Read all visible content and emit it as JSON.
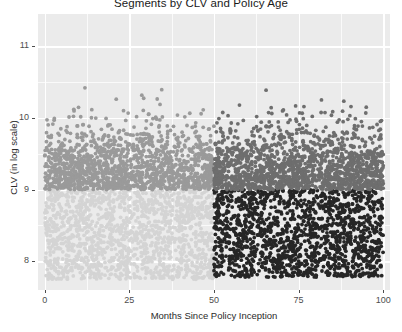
{
  "chart_data": {
    "type": "scatter",
    "title": "Segments by CLV and Policy Age",
    "xlabel": "Months Since Policy Inception",
    "ylabel": "CLV (in log scale)",
    "xlim": [
      -2,
      102
    ],
    "ylim": [
      7.6,
      11.45
    ],
    "xticks": [
      0,
      25,
      50,
      75,
      100
    ],
    "xtick_labels": [
      "0",
      "25",
      "50",
      "75",
      "100"
    ],
    "yticks": [
      8,
      9,
      10,
      11
    ],
    "ytick_labels": [
      "8",
      "9",
      "10",
      "11"
    ],
    "grid": true,
    "legend": "none",
    "panel_background": "#EBEBEB",
    "gridline_color": "#FFFFFF",
    "point_radius": 1.9,
    "series": [
      {
        "name": "segment-low-clv-new-policy",
        "color": "#D4D4D4",
        "n_points": 1500,
        "x_range": [
          0,
          50
        ],
        "y_range": [
          7.75,
          9.0
        ],
        "x_mean": 25,
        "y_mean": 8.45,
        "description": "Light gray cluster: low CLV, policy age 0-50 months"
      },
      {
        "name": "segment-high-clv-new-policy",
        "color": "#9A9A9A",
        "n_points": 1500,
        "x_range": [
          0,
          50
        ],
        "y_range": [
          9.0,
          11.35
        ],
        "x_mean": 25,
        "y_mean": 9.55,
        "description": "Medium gray cluster: high CLV, policy age 0-50 months"
      },
      {
        "name": "segment-low-clv-mature-policy",
        "color": "#262626",
        "n_points": 1500,
        "x_range": [
          50,
          100
        ],
        "y_range": [
          7.78,
          9.0
        ],
        "x_mean": 75,
        "y_mean": 8.45,
        "description": "Dark cluster: low CLV, policy age 50-100 months"
      },
      {
        "name": "segment-high-clv-mature-policy",
        "color": "#6E6E6E",
        "n_points": 1500,
        "x_range": [
          50,
          100
        ],
        "y_range": [
          9.0,
          11.4
        ],
        "x_mean": 75,
        "y_mean": 9.6,
        "description": "Medium-dark gray cluster: high CLV, policy age 50-100 months"
      }
    ]
  }
}
